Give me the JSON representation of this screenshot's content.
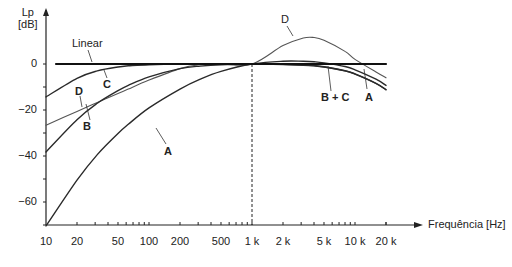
{
  "chart_data": {
    "type": "line",
    "title": "",
    "xlabel": "Frequência [Hz]",
    "ylabel": "Lp [dB]",
    "ylabel_lines": [
      "Lp",
      "[dB]"
    ],
    "x_scale": "log",
    "xlim": [
      10,
      20000
    ],
    "ylim": [
      -70,
      15
    ],
    "x_ticks": [
      10,
      20,
      50,
      100,
      200,
      500,
      1000,
      2000,
      5000,
      10000,
      20000
    ],
    "x_tick_labels": [
      "10",
      "20",
      "50",
      "100",
      "200",
      "500",
      "1 k",
      "2 k",
      "5 k",
      "10 k",
      "20 k"
    ],
    "y_ticks": [
      0,
      -20,
      -40,
      -60
    ],
    "y_tick_labels": [
      "0",
      "-20",
      "-40",
      "-60"
    ],
    "grid": false,
    "reference_line": {
      "x": 1000,
      "style": "dashed"
    },
    "x": [
      10,
      20,
      31.5,
      50,
      63,
      100,
      200,
      315,
      500,
      1000,
      2000,
      3150,
      4000,
      5000,
      8000,
      10000,
      16000,
      20000
    ],
    "series": [
      {
        "name": "Linear",
        "label": "Linear",
        "values": [
          0,
          0,
          0,
          0,
          0,
          0,
          0,
          0,
          0,
          0,
          0,
          0,
          0,
          0,
          0,
          0,
          0,
          0
        ]
      },
      {
        "name": "A",
        "label": "A",
        "values": [
          -70.4,
          -50.5,
          -39.4,
          -30.2,
          -26.2,
          -19.1,
          -10.9,
          -6.6,
          -3.2,
          0,
          1.2,
          1.2,
          1.0,
          0.5,
          -1.1,
          -2.5,
          -6.6,
          -9.3
        ]
      },
      {
        "name": "B",
        "label": "B",
        "values": [
          -38.2,
          -24.2,
          -17.1,
          -11.6,
          -9.3,
          -5.6,
          -2.0,
          -0.9,
          -0.3,
          0,
          -0.1,
          -0.5,
          -0.7,
          -1.2,
          -2.9,
          -4.3,
          -8.4,
          -11.1
        ]
      },
      {
        "name": "C",
        "label": "C",
        "values": [
          -14.3,
          -6.2,
          -3.0,
          -1.3,
          -0.8,
          -0.3,
          0,
          0,
          0,
          0,
          -0.2,
          -0.5,
          -0.8,
          -1.3,
          -3.0,
          -4.4,
          -8.5,
          -11.2
        ]
      },
      {
        "name": "D",
        "label": "D",
        "values": [
          -26.6,
          -20.6,
          -16.7,
          -12.8,
          -10.9,
          -7.0,
          -2.0,
          -0.3,
          0,
          0,
          8.0,
          11.3,
          11.5,
          10.3,
          5.5,
          2.0,
          -3.5,
          -6.0
        ]
      }
    ],
    "annotations": [
      "Linear",
      "A",
      "B",
      "C",
      "D",
      "B + C",
      "A",
      "D"
    ]
  },
  "labels": {
    "ylabel_line1": "Lp",
    "ylabel_line2": "[dB]",
    "xlabel": "Frequência [Hz]",
    "linear": "Linear",
    "curve_c": "C",
    "curve_d_low": "D",
    "curve_b": "B",
    "curve_a_low": "A",
    "curve_d_high": "D",
    "curve_bc_high": "B + C",
    "curve_a_high": "A"
  },
  "colors": {
    "axis": "#222222",
    "linear": "#111111",
    "weighting_dark": "#2a2a2a",
    "weighting_light": "#555555",
    "background": "#ffffff"
  }
}
